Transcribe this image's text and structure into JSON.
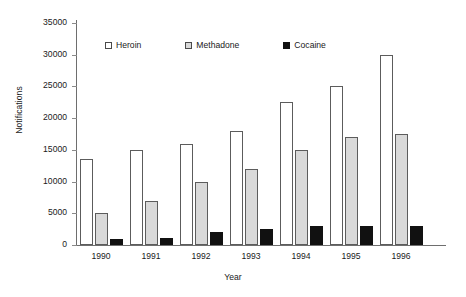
{
  "chart_data": {
    "type": "bar",
    "title": "",
    "xlabel": "Year",
    "ylabel": "Notifications",
    "categories": [
      "1990",
      "1991",
      "1992",
      "1993",
      "1994",
      "1995",
      "1996"
    ],
    "series": [
      {
        "name": "Heroin",
        "values": [
          13500,
          15000,
          16000,
          18000,
          22500,
          25000,
          30000
        ],
        "color": "#ffffff"
      },
      {
        "name": "Methadone",
        "values": [
          5000,
          7000,
          10000,
          12000,
          15000,
          17000,
          17500
        ],
        "color": "#d9d9d9"
      },
      {
        "name": "Cocaine",
        "values": [
          1000,
          1100,
          2000,
          2500,
          3000,
          3000,
          3000
        ],
        "color": "#111111"
      }
    ],
    "ylim": [
      0,
      35000
    ],
    "yticks": [
      0,
      5000,
      10000,
      15000,
      20000,
      25000,
      30000,
      35000
    ],
    "ytick_labels": [
      "0",
      "5000",
      "10000",
      "15000",
      "20000",
      "25000",
      "30000",
      "35000"
    ],
    "grid": false,
    "legend_position": "top-inside",
    "legend": [
      "Heroin",
      "Methadone",
      "Cocaine"
    ]
  }
}
